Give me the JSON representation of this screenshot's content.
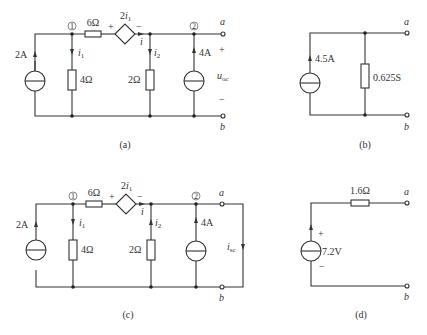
{
  "figures": {
    "a": {
      "caption": "(a)",
      "current_source_left": {
        "label": "2A"
      },
      "node1": {
        "label": "1"
      },
      "node2": {
        "label": "2"
      },
      "resistor_series": {
        "label": "6Ω"
      },
      "dependent_source": {
        "label_coef": "2",
        "label_var": "i",
        "label_sub": "1",
        "plus": "+",
        "minus": "−"
      },
      "current_i": {
        "label": "i"
      },
      "i1": {
        "var": "i",
        "sub": "1"
      },
      "i2": {
        "var": "i",
        "sub": "2"
      },
      "resistor_4": {
        "label": "4Ω"
      },
      "resistor_2": {
        "label": "2Ω"
      },
      "current_source_right": {
        "label": "4A"
      },
      "terminal_a": "a",
      "terminal_b": "b",
      "voc": {
        "var": "u",
        "sub": "oc",
        "plus": "+",
        "minus": "−"
      }
    },
    "b": {
      "caption": "(b)",
      "current_source": {
        "label": "4.5A"
      },
      "conductance": {
        "label": "0.625S"
      },
      "terminal_a": "a",
      "terminal_b": "b"
    },
    "c": {
      "caption": "(c)",
      "current_source_left": {
        "label": "2A"
      },
      "node1": {
        "label": "1"
      },
      "node2": {
        "label": "2"
      },
      "resistor_series": {
        "label": "6Ω"
      },
      "dependent_source": {
        "label_coef": "2",
        "label_var": "i",
        "label_sub": "1",
        "plus": "+",
        "minus": "−"
      },
      "current_i": {
        "label": "i"
      },
      "i1": {
        "var": "i",
        "sub": "1"
      },
      "i2": {
        "var": "i",
        "sub": "2"
      },
      "resistor_4": {
        "label": "4Ω"
      },
      "resistor_2": {
        "label": "2Ω"
      },
      "current_source_right": {
        "label": "4A"
      },
      "terminal_a": "a",
      "terminal_b": "b",
      "isc": {
        "var": "i",
        "sub": "sc"
      }
    },
    "d": {
      "caption": "(d)",
      "resistor": {
        "label": "1.6Ω"
      },
      "voltage_source": {
        "label": "7.2V",
        "plus": "+",
        "minus": "−"
      },
      "terminal_a": "a",
      "terminal_b": "b"
    }
  }
}
